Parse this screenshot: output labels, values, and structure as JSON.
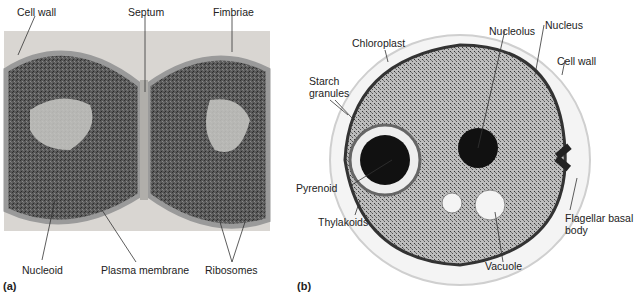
{
  "panel_a": {
    "tag": "(a)",
    "labels": {
      "cell_wall": "Cell wall",
      "septum": "Septum",
      "fimbriae": "Fimbriae",
      "nucleoid": "Nucleoid",
      "plasma_membrane": "Plasma membrane",
      "ribosomes": "Ribosomes"
    }
  },
  "panel_b": {
    "tag": "(b)",
    "labels": {
      "chloroplast": "Chloroplast",
      "nucleolus": "Nucleolus",
      "nucleus": "Nucleus",
      "cell_wall": "Cell wall",
      "starch_granules_1": "Starch",
      "starch_granules_2": "granules",
      "pyrenoid": "Pyrenoid",
      "thylakoids": "Thylakoids",
      "flagellar_basal_body_1": "Flagellar basal",
      "flagellar_basal_body_2": "body",
      "vacuole": "Vacuole"
    }
  }
}
